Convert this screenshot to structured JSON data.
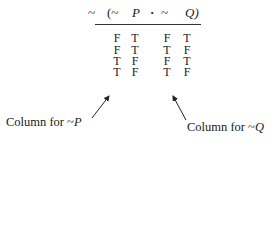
{
  "formula": {
    "neg_outer": "~",
    "open_paren": "(~",
    "var_p": "P",
    "dot": "·",
    "neg_q": "~",
    "var_q": "Q)"
  },
  "table": {
    "columns": [
      "~P",
      "~Q"
    ],
    "rows": [
      [
        "F",
        "T",
        "F",
        "T"
      ],
      [
        "F",
        "T",
        "T",
        "F"
      ],
      [
        "T",
        "F",
        "F",
        "T"
      ],
      [
        "T",
        "F",
        "T",
        "F"
      ]
    ]
  },
  "annotations": {
    "left": {
      "prefix": "Column for ",
      "tilde": "~",
      "var": "P"
    },
    "right": {
      "prefix": "Column for ",
      "tilde": "~",
      "var": "Q"
    }
  }
}
